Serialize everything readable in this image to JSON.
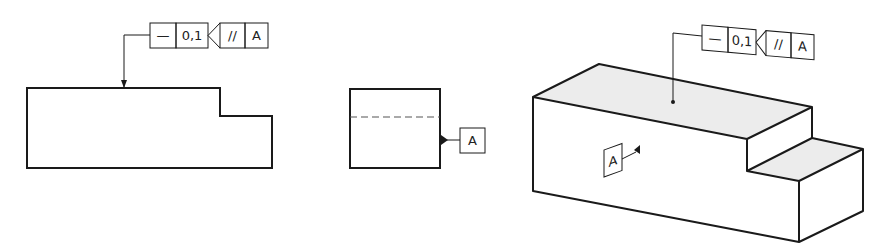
{
  "feature_control_frame": {
    "symbol": "—",
    "tolerance": "0,1",
    "parallel_symbol": "//",
    "datum": "A"
  },
  "datum_label": "A",
  "colors": {
    "line": "#1a1a1a",
    "shaded_face": "#ececec",
    "background": "#ffffff"
  },
  "views": [
    "front-view",
    "side-view",
    "isometric-view"
  ]
}
